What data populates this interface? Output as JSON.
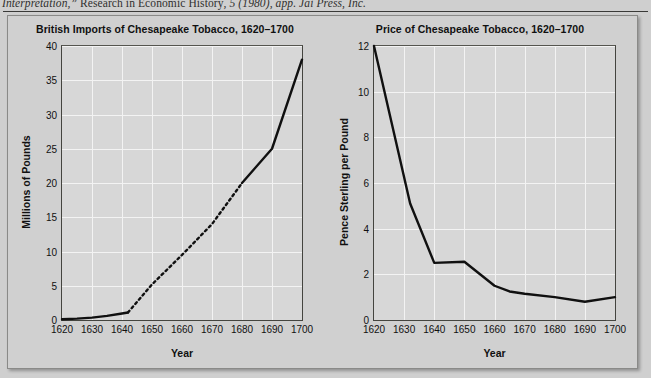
{
  "caption": {
    "text_italic_1": "Interpretation,” ",
    "text_roman": "Research in Economic History",
    "text_italic_2": ", 5 (1980), app. Jai Press, Inc."
  },
  "figure": {
    "panels": [
      {
        "id": "imports",
        "chart_data": {
          "type": "line",
          "title": "British Imports of Chesapeake Tobacco, 1620–1700",
          "xlabel": "Year",
          "ylabel": "Millions of Pounds",
          "xlim": [
            1620,
            1700
          ],
          "ylim": [
            0,
            40
          ],
          "xticks": [
            1620,
            1630,
            1640,
            1650,
            1660,
            1670,
            1680,
            1690,
            1700
          ],
          "yticks": [
            0,
            5,
            10,
            15,
            20,
            25,
            30,
            35,
            40
          ],
          "grid": true,
          "legend": "none",
          "series": [
            {
              "name": "British imports of Chesapeake tobacco",
              "x": [
                1620,
                1625,
                1630,
                1635,
                1640,
                1642,
                1650,
                1660,
                1670,
                1680,
                1690,
                1700
              ],
              "values": [
                0.1,
                0.2,
                0.35,
                0.6,
                0.95,
                1.1,
                5.2,
                9.5,
                14.0,
                20.0,
                25.0,
                38.0
              ],
              "style": "solid-then-dashed-then-solid",
              "dashed_from": 1642,
              "dashed_to": 1680
            }
          ]
        }
      },
      {
        "id": "price",
        "chart_data": {
          "type": "line",
          "title": "Price of Chesapeake Tobacco, 1620–1700",
          "xlabel": "Year",
          "ylabel": "Pence Sterling per Pound",
          "xlim": [
            1620,
            1700
          ],
          "ylim": [
            0,
            12
          ],
          "xticks": [
            1620,
            1630,
            1640,
            1650,
            1660,
            1670,
            1680,
            1690,
            1700
          ],
          "yticks": [
            0,
            2,
            4,
            6,
            8,
            10,
            12
          ],
          "grid": true,
          "legend": "none",
          "series": [
            {
              "name": "Price of Chesapeake tobacco",
              "x": [
                1620,
                1632,
                1640,
                1650,
                1660,
                1665,
                1670,
                1680,
                1690,
                1700
              ],
              "values": [
                12.0,
                5.1,
                2.5,
                2.55,
                1.5,
                1.25,
                1.15,
                1.0,
                0.8,
                1.0
              ],
              "style": "solid"
            }
          ]
        }
      }
    ]
  }
}
